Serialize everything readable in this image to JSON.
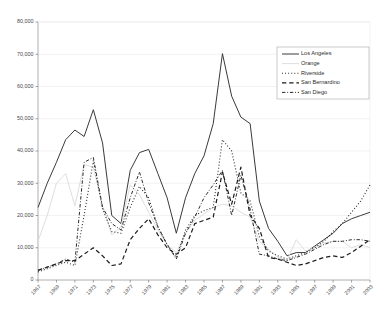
{
  "chart_data": {
    "type": "line",
    "title": "",
    "xlabel": "",
    "ylabel": "",
    "ylim": [
      0,
      80000
    ],
    "ytick_values": [
      0,
      10000,
      20000,
      30000,
      40000,
      50000,
      60000,
      70000,
      80000
    ],
    "ytick_labels": [
      "0",
      "10,000",
      "20,000",
      "30,000",
      "40,000",
      "50,000",
      "60,000",
      "70,000",
      "80,000"
    ],
    "grid": true,
    "legend_position": "top-right",
    "x": [
      1967,
      1968,
      1969,
      1970,
      1971,
      1972,
      1973,
      1974,
      1975,
      1976,
      1977,
      1978,
      1979,
      1980,
      1981,
      1982,
      1983,
      1984,
      1985,
      1986,
      1987,
      1988,
      1989,
      1990,
      1991,
      1992,
      1993,
      1994,
      1995,
      1996,
      1997,
      1998,
      1999,
      2000,
      2001,
      2002,
      2003
    ],
    "xtick_labels": [
      "1967",
      "1969",
      "1971",
      "1973",
      "1975",
      "1977",
      "1979",
      "1981",
      "1983",
      "1985",
      "1987",
      "1989",
      "1991",
      "1993",
      "1995",
      "1997",
      "1999",
      "2001",
      "2003"
    ],
    "xtick_step": 2,
    "series": [
      {
        "name": "Los Angeles",
        "style": "solid",
        "color": "#3a3a3a",
        "width": 1.0,
        "values": [
          22500,
          30000,
          36500,
          43500,
          46500,
          44500,
          52800,
          42500,
          20000,
          17500,
          34000,
          39500,
          40500,
          33000,
          25500,
          14500,
          25500,
          33000,
          38500,
          48500,
          70200,
          57000,
          50500,
          48500,
          24500,
          16000,
          12000,
          7500,
          8500,
          8500,
          10500,
          12500,
          14500,
          17500,
          19000,
          20000,
          21000
        ]
      },
      {
        "name": "Orange",
        "style": "solid",
        "color": "#dedede",
        "width": 1.0,
        "values": [
          12000,
          20000,
          30000,
          33000,
          23000,
          35800,
          35000,
          23000,
          14000,
          16500,
          29500,
          26500,
          21000,
          15500,
          11000,
          8500,
          14500,
          18500,
          20500,
          22500,
          23500,
          23000,
          21000,
          19500,
          12000,
          9500,
          7000,
          6000,
          12500,
          9000,
          10000,
          11500,
          12000,
          12000,
          10000,
          11000,
          10000
        ]
      },
      {
        "name": "Riverside",
        "style": "dotted",
        "color": "#2b2b2b",
        "width": 1.1,
        "values": [
          2500,
          3500,
          4500,
          5500,
          4500,
          20000,
          37000,
          22000,
          15000,
          14500,
          22500,
          29000,
          25500,
          16500,
          11000,
          7000,
          15500,
          20000,
          21500,
          22500,
          43500,
          40000,
          27000,
          24500,
          13500,
          9000,
          7500,
          6500,
          7500,
          8500,
          10000,
          12000,
          15000,
          17500,
          21000,
          24500,
          29500
        ]
      },
      {
        "name": "San Bernardino",
        "style": "dashed",
        "color": "#1a1a1a",
        "width": 1.2,
        "values": [
          3000,
          4000,
          5000,
          6000,
          6000,
          8000,
          10000,
          7500,
          4500,
          5000,
          12500,
          16000,
          19000,
          14000,
          10000,
          8000,
          10000,
          17500,
          18500,
          19500,
          33500,
          23500,
          35000,
          20000,
          16000,
          7000,
          6500,
          5500,
          4500,
          5000,
          6000,
          7000,
          7500,
          7000,
          8500,
          10500,
          12500
        ]
      },
      {
        "name": "San Diego",
        "style": "dashdot",
        "color": "#2b2b2b",
        "width": 1.0,
        "values": [
          3000,
          4000,
          5000,
          6500,
          5500,
          36500,
          38000,
          22500,
          17500,
          15500,
          25500,
          33500,
          24000,
          16500,
          11000,
          6500,
          14500,
          19500,
          25500,
          29500,
          34000,
          20000,
          32500,
          22000,
          8000,
          7500,
          6500,
          6000,
          7000,
          8000,
          9500,
          11000,
          12000,
          12000,
          12500,
          12500,
          12000
        ]
      }
    ]
  }
}
